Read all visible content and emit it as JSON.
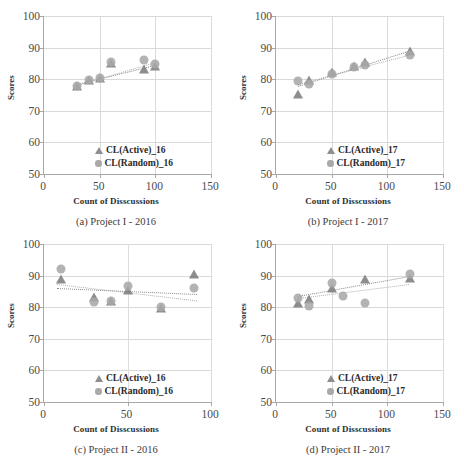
{
  "figure": {
    "axis_titles": {
      "y": "Scores",
      "x": "Count of Disscussions"
    }
  },
  "panels": [
    {
      "id": "a",
      "caption": "(a) Project I - 2016",
      "xticks": [
        "0",
        "50",
        "100",
        "150"
      ],
      "yticks": [
        "100",
        "90",
        "80",
        "70",
        "60",
        "50"
      ],
      "legend": [
        {
          "marker": "triangle",
          "label": "CL(Active)_16"
        },
        {
          "marker": "circle",
          "label": "CL(Random)_16"
        }
      ]
    },
    {
      "id": "b",
      "caption": "(b) Project I - 2017",
      "xticks": [
        "0",
        "50",
        "100",
        "150"
      ],
      "yticks": [
        "100",
        "90",
        "80",
        "70",
        "60",
        "50"
      ],
      "legend": [
        {
          "marker": "triangle",
          "label": "CL(Active)_17"
        },
        {
          "marker": "circle",
          "label": "CL(Random)_17"
        }
      ]
    },
    {
      "id": "c",
      "caption": "(c) Project II - 2016",
      "xticks": [
        "0",
        "50",
        "100"
      ],
      "yticks": [
        "100",
        "90",
        "80",
        "70",
        "60",
        "50"
      ],
      "legend": [
        {
          "marker": "triangle",
          "label": "CL(Active)_16"
        },
        {
          "marker": "circle",
          "label": "CL(Random)_16"
        }
      ]
    },
    {
      "id": "d",
      "caption": "(d) Project II - 2017",
      "xticks": [
        "0",
        "50",
        "100",
        "150"
      ],
      "yticks": [
        "100",
        "90",
        "80",
        "70",
        "60",
        "50"
      ],
      "legend": [
        {
          "marker": "triangle",
          "label": "CL(Active)_17"
        },
        {
          "marker": "circle",
          "label": "CL(Random)_17"
        }
      ]
    }
  ],
  "chart_data": [
    {
      "type": "scatter",
      "title": "(a) Project I - 2016",
      "xlabel": "Count of Disscussions",
      "ylabel": "Scores",
      "xlim": [
        0,
        150
      ],
      "ylim": [
        50,
        100
      ],
      "xticks": [
        0,
        50,
        100,
        150
      ],
      "yticks": [
        50,
        60,
        70,
        80,
        90,
        100
      ],
      "grid": true,
      "legend_position": "lower-right",
      "series": [
        {
          "name": "CL(Active)_16",
          "marker": "triangle",
          "color": "#7d7d7d",
          "points": [
            [
              30,
              78.0
            ],
            [
              40,
              79.8
            ],
            [
              50,
              80.3
            ],
            [
              60,
              85.0
            ],
            [
              90,
              83.2
            ],
            [
              100,
              84.2
            ]
          ],
          "trendline": {
            "style": "dotted",
            "from": [
              30,
              78.6
            ],
            "to": [
              100,
              84.6
            ]
          }
        },
        {
          "name": "CL(Random)_16",
          "marker": "circle",
          "color": "#a8a8a8",
          "points": [
            [
              30,
              77.7
            ],
            [
              40,
              79.7
            ],
            [
              50,
              80.4
            ],
            [
              60,
              85.5
            ],
            [
              90,
              86.0
            ],
            [
              100,
              84.8
            ]
          ],
          "trendline": {
            "style": "dotted",
            "from": [
              30,
              78.2
            ],
            "to": [
              100,
              85.4
            ]
          }
        }
      ]
    },
    {
      "type": "scatter",
      "title": "(b) Project I - 2017",
      "xlabel": "Count of Disscussions",
      "ylabel": "Scores",
      "xlim": [
        0,
        150
      ],
      "ylim": [
        50,
        100
      ],
      "xticks": [
        0,
        50,
        100,
        150
      ],
      "yticks": [
        50,
        60,
        70,
        80,
        90,
        100
      ],
      "grid": true,
      "legend_position": "lower-right",
      "series": [
        {
          "name": "CL(Active)_17",
          "marker": "triangle",
          "color": "#7d7d7d",
          "points": [
            [
              20,
              75.2
            ],
            [
              30,
              79.6
            ],
            [
              50,
              82.4
            ],
            [
              70,
              84.3
            ],
            [
              80,
              85.3
            ],
            [
              120,
              88.9
            ]
          ],
          "trendline": {
            "style": "dotted",
            "from": [
              20,
              77.8
            ],
            "to": [
              120,
              89.0
            ]
          }
        },
        {
          "name": "CL(Random)_17",
          "marker": "circle",
          "color": "#a8a8a8",
          "points": [
            [
              20,
              79.3
            ],
            [
              30,
              78.6
            ],
            [
              50,
              81.7
            ],
            [
              70,
              83.8
            ],
            [
              80,
              84.6
            ],
            [
              120,
              87.7
            ]
          ],
          "trendline": {
            "style": "dotted",
            "from": [
              20,
              78.6
            ],
            "to": [
              120,
              87.9
            ]
          }
        }
      ]
    },
    {
      "type": "scatter",
      "title": "(c) Project II - 2016",
      "xlabel": "Count of Disscussions",
      "ylabel": "Scores",
      "xlim": [
        0,
        100
      ],
      "ylim": [
        50,
        100
      ],
      "xticks": [
        0,
        50,
        100
      ],
      "yticks": [
        50,
        60,
        70,
        80,
        90,
        100
      ],
      "grid": true,
      "legend_position": "lower-right",
      "series": [
        {
          "name": "CL(Active)_16",
          "marker": "triangle",
          "color": "#7d7d7d",
          "points": [
            [
              10,
              88.8
            ],
            [
              30,
              83.2
            ],
            [
              40,
              82.0
            ],
            [
              50,
              85.6
            ],
            [
              70,
              79.8
            ],
            [
              90,
              90.4
            ]
          ],
          "trendline": {
            "style": "dotted",
            "from": [
              8,
              86.0
            ],
            "to": [
              92,
              84.1
            ]
          }
        },
        {
          "name": "CL(Random)_16",
          "marker": "circle",
          "color": "#a8a8a8",
          "points": [
            [
              10,
              92.2
            ],
            [
              30,
              81.7
            ],
            [
              40,
              82.1
            ],
            [
              50,
              86.6
            ],
            [
              70,
              80.2
            ],
            [
              90,
              86.2
            ]
          ],
          "trendline": {
            "style": "dotted",
            "from": [
              8,
              87.2
            ],
            "to": [
              92,
              82.0
            ]
          }
        }
      ]
    },
    {
      "type": "scatter",
      "title": "(d) Project II - 2017",
      "xlabel": "Count of Disscussions",
      "ylabel": "Scores",
      "xlim": [
        0,
        150
      ],
      "ylim": [
        50,
        100
      ],
      "xticks": [
        0,
        50,
        100,
        150
      ],
      "yticks": [
        50,
        60,
        70,
        80,
        90,
        100
      ],
      "grid": true,
      "legend_position": "lower-right",
      "series": [
        {
          "name": "CL(Active)_17",
          "marker": "triangle",
          "color": "#7d7d7d",
          "points": [
            [
              20,
              81.3
            ],
            [
              30,
              82.6
            ],
            [
              50,
              86.0
            ],
            [
              80,
              89.0
            ],
            [
              120,
              89.3
            ]
          ],
          "trendline": {
            "style": "dotted",
            "from": [
              20,
              83.5
            ],
            "to": [
              120,
              89.8
            ]
          }
        },
        {
          "name": "CL(Random)_17",
          "marker": "circle",
          "color": "#a8a8a8",
          "points": [
            [
              20,
              82.9
            ],
            [
              30,
              80.5
            ],
            [
              50,
              87.8
            ],
            [
              60,
              83.4
            ],
            [
              80,
              81.4
            ],
            [
              120,
              90.5
            ]
          ],
          "trendline": {
            "style": "dotted",
            "from": [
              20,
              82.8
            ],
            "to": [
              120,
              87.2
            ]
          }
        }
      ]
    }
  ]
}
